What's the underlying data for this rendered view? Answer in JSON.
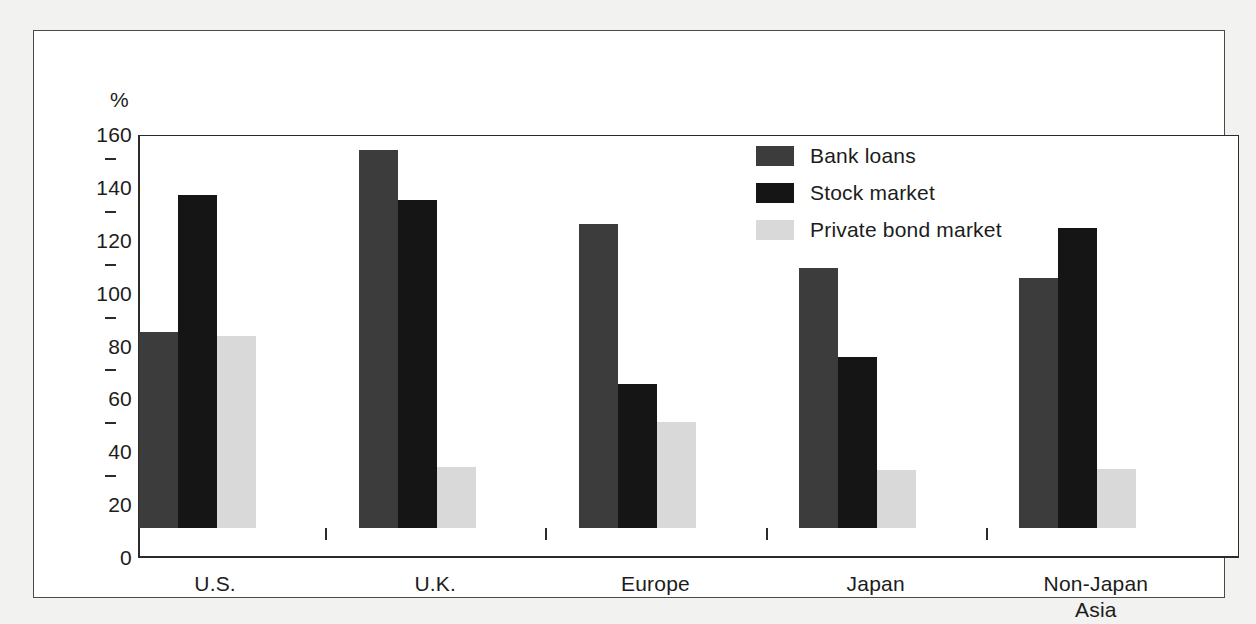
{
  "chart_data": {
    "type": "bar",
    "title": "",
    "subtitle": "",
    "xlabel": "",
    "ylabel": "%",
    "ylim": [
      0,
      160
    ],
    "yticks": [
      0,
      20,
      40,
      60,
      80,
      100,
      120,
      140,
      160
    ],
    "ytick_labels": [
      "0",
      "20",
      "40",
      "60",
      "80",
      "100",
      "120",
      "140",
      "160"
    ],
    "grid": false,
    "legend_position": "top-right",
    "categories": [
      "U.S.",
      "U.K.",
      "Europe",
      "Japan",
      "Non-Japan Asia"
    ],
    "category_lines": [
      [
        "U.S."
      ],
      [
        "U.K."
      ],
      [
        "Europe"
      ],
      [
        "Japan"
      ],
      [
        "Non-Japan",
        "Asia"
      ]
    ],
    "series": [
      {
        "name": "Bank loans",
        "color": "#3c3c3c",
        "values": [
          74,
          143,
          115,
          98.5,
          94.5
        ]
      },
      {
        "name": "Stock market",
        "color": "#151515",
        "values": [
          126,
          124,
          54.5,
          64.5,
          113.5
        ]
      },
      {
        "name": "Private bond market",
        "color": "#d9d9d9",
        "values": [
          72.5,
          23,
          40,
          22,
          22.5
        ]
      }
    ]
  },
  "axis": {
    "unit_label": "%"
  },
  "legend": {
    "items": [
      {
        "label": "Bank loans",
        "color": "#3c3c3c"
      },
      {
        "label": "Stock market",
        "color": "#151515"
      },
      {
        "label": "Private bond market",
        "color": "#d9d9d9"
      }
    ]
  }
}
